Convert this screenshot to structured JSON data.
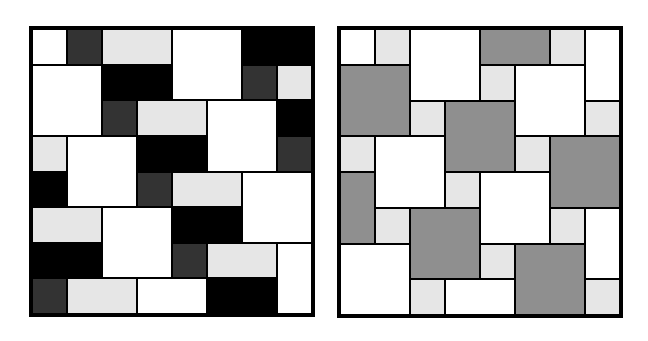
{
  "colors": {
    "W": "#ffffff",
    "LG": "#e6e6e6",
    "DG": "#333333",
    "B": "#000000",
    "G": "#8f8f8f"
  },
  "panels": [
    {
      "name": "left-tiling-pattern",
      "x": 29,
      "y": 26,
      "width": 286,
      "height": 291,
      "grid": 8,
      "tiles": [
        [
          0,
          0,
          1,
          1,
          "W"
        ],
        [
          1,
          0,
          1,
          1,
          "DG"
        ],
        [
          2,
          0,
          2,
          1,
          "LG"
        ],
        [
          4,
          0,
          2,
          2,
          "W"
        ],
        [
          6,
          0,
          2,
          1,
          "B"
        ],
        [
          0,
          1,
          2,
          2,
          "W"
        ],
        [
          2,
          1,
          2,
          1,
          "B"
        ],
        [
          6,
          1,
          1,
          1,
          "DG"
        ],
        [
          7,
          1,
          1,
          1,
          "LG"
        ],
        [
          2,
          2,
          1,
          1,
          "DG"
        ],
        [
          3,
          2,
          2,
          1,
          "LG"
        ],
        [
          5,
          2,
          2,
          2,
          "W"
        ],
        [
          7,
          2,
          1,
          1,
          "B"
        ],
        [
          0,
          3,
          1,
          1,
          "LG"
        ],
        [
          1,
          3,
          2,
          2,
          "W"
        ],
        [
          3,
          3,
          2,
          1,
          "B"
        ],
        [
          7,
          3,
          1,
          1,
          "DG"
        ],
        [
          0,
          4,
          1,
          1,
          "B"
        ],
        [
          3,
          4,
          1,
          1,
          "DG"
        ],
        [
          4,
          4,
          2,
          1,
          "LG"
        ],
        [
          6,
          4,
          2,
          2,
          "W"
        ],
        [
          0,
          5,
          2,
          1,
          "LG"
        ],
        [
          2,
          5,
          2,
          2,
          "W"
        ],
        [
          4,
          5,
          2,
          1,
          "B"
        ],
        [
          0,
          6,
          2,
          1,
          "B"
        ],
        [
          4,
          6,
          1,
          1,
          "DG"
        ],
        [
          5,
          6,
          2,
          1,
          "LG"
        ],
        [
          7,
          6,
          1,
          2,
          "W"
        ],
        [
          0,
          7,
          1,
          1,
          "DG"
        ],
        [
          1,
          7,
          2,
          1,
          "LG"
        ],
        [
          3,
          7,
          2,
          1,
          "W"
        ],
        [
          5,
          7,
          2,
          1,
          "B"
        ]
      ]
    },
    {
      "name": "right-tiling-pattern",
      "x": 337,
      "y": 26,
      "width": 286,
      "height": 292,
      "grid": 8,
      "tiles": [
        [
          0,
          0,
          1,
          1,
          "W"
        ],
        [
          1,
          0,
          1,
          1,
          "LG"
        ],
        [
          2,
          0,
          2,
          2,
          "W"
        ],
        [
          4,
          0,
          2,
          1,
          "G"
        ],
        [
          6,
          0,
          1,
          1,
          "LG"
        ],
        [
          7,
          0,
          1,
          2,
          "W"
        ],
        [
          0,
          1,
          2,
          2,
          "G"
        ],
        [
          4,
          1,
          1,
          1,
          "LG"
        ],
        [
          5,
          1,
          2,
          2,
          "W"
        ],
        [
          2,
          2,
          1,
          1,
          "LG"
        ],
        [
          3,
          2,
          2,
          2,
          "G"
        ],
        [
          7,
          2,
          1,
          1,
          "LG"
        ],
        [
          0,
          3,
          1,
          1,
          "LG"
        ],
        [
          1,
          3,
          2,
          2,
          "W"
        ],
        [
          5,
          3,
          1,
          1,
          "LG"
        ],
        [
          6,
          3,
          2,
          2,
          "G"
        ],
        [
          0,
          4,
          1,
          2,
          "G"
        ],
        [
          3,
          4,
          1,
          1,
          "LG"
        ],
        [
          4,
          4,
          2,
          2,
          "W"
        ],
        [
          1,
          5,
          1,
          1,
          "LG"
        ],
        [
          2,
          5,
          2,
          2,
          "G"
        ],
        [
          6,
          5,
          1,
          1,
          "LG"
        ],
        [
          7,
          5,
          1,
          2,
          "W"
        ],
        [
          0,
          6,
          2,
          2,
          "W"
        ],
        [
          4,
          6,
          1,
          1,
          "LG"
        ],
        [
          5,
          6,
          2,
          2,
          "G"
        ],
        [
          2,
          7,
          1,
          1,
          "LG"
        ],
        [
          3,
          7,
          2,
          1,
          "W"
        ],
        [
          7,
          7,
          1,
          1,
          "LG"
        ]
      ]
    }
  ]
}
